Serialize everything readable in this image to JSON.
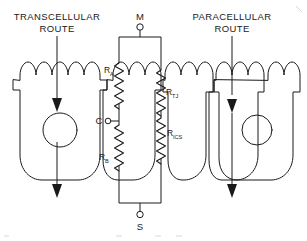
{
  "figure": {
    "title_left": "TRANSCELLULAR",
    "title_left_line2": "ROUTE",
    "title_right": "PARACELLULAR",
    "title_right_line2": "ROUTE",
    "colors": {
      "ink": "#1a1a1a",
      "background": "#ffffff"
    }
  },
  "terminals": [
    {
      "id": "mucosal",
      "label": "M"
    },
    {
      "id": "cell",
      "label": "C"
    },
    {
      "id": "serosal",
      "label": "S"
    }
  ],
  "resistors": [
    {
      "id": "apical",
      "base": "R",
      "sub": "A"
    },
    {
      "id": "tight-junction",
      "base": "R",
      "sub": "TJ"
    },
    {
      "id": "basolateral",
      "base": "R",
      "sub": "B"
    },
    {
      "id": "intercellular-space",
      "base": "R",
      "sub": "ICS"
    }
  ],
  "routes": [
    {
      "id": "transcellular-arrow-upper",
      "direction": "down"
    },
    {
      "id": "transcellular-arrow-lower",
      "direction": "down"
    },
    {
      "id": "paracellular-arrow",
      "direction": "down"
    }
  ],
  "cells": [
    {
      "id": "cell-1",
      "nucleus": true
    },
    {
      "id": "cell-2",
      "nucleus": false
    },
    {
      "id": "cell-3",
      "nucleus": false
    },
    {
      "id": "cell-4",
      "nucleus": false
    },
    {
      "id": "cell-5",
      "nucleus": true
    }
  ]
}
